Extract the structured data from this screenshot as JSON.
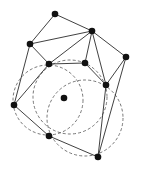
{
  "diagram": {
    "type": "delaunay-triangulation-empty-circle",
    "colors": {
      "edge": "#2b2b2b",
      "circle": "#555555",
      "node": "#111111",
      "background": "#ffffff"
    },
    "nodes": [
      {
        "id": "n0",
        "x": 55,
        "y": 14
      },
      {
        "id": "n1",
        "x": 92,
        "y": 31
      },
      {
        "id": "n2",
        "x": 30,
        "y": 44
      },
      {
        "id": "n3",
        "x": 126,
        "y": 57
      },
      {
        "id": "n4",
        "x": 49,
        "y": 64
      },
      {
        "id": "n5",
        "x": 85,
        "y": 63
      },
      {
        "id": "n6",
        "x": 106,
        "y": 85
      },
      {
        "id": "n7",
        "x": 64,
        "y": 98
      },
      {
        "id": "n8",
        "x": 14,
        "y": 105
      },
      {
        "id": "n9",
        "x": 49,
        "y": 136
      },
      {
        "id": "n10",
        "x": 98,
        "y": 157
      }
    ],
    "edges": [
      [
        "n0",
        "n1"
      ],
      [
        "n0",
        "n2"
      ],
      [
        "n1",
        "n2"
      ],
      [
        "n1",
        "n4"
      ],
      [
        "n1",
        "n5"
      ],
      [
        "n1",
        "n6"
      ],
      [
        "n1",
        "n3"
      ],
      [
        "n2",
        "n4"
      ],
      [
        "n2",
        "n8"
      ],
      [
        "n4",
        "n8"
      ],
      [
        "n4",
        "n5"
      ],
      [
        "n5",
        "n6"
      ],
      [
        "n3",
        "n6"
      ],
      [
        "n3",
        "n10"
      ],
      [
        "n6",
        "n10"
      ],
      [
        "n8",
        "n9"
      ],
      [
        "n9",
        "n10"
      ]
    ],
    "circles": [
      {
        "id": "c0",
        "cx": 48,
        "cy": 100,
        "r": 35
      },
      {
        "id": "c1",
        "cx": 70,
        "cy": 97,
        "r": 37
      },
      {
        "id": "c2",
        "cx": 85,
        "cy": 118,
        "r": 38
      }
    ]
  }
}
